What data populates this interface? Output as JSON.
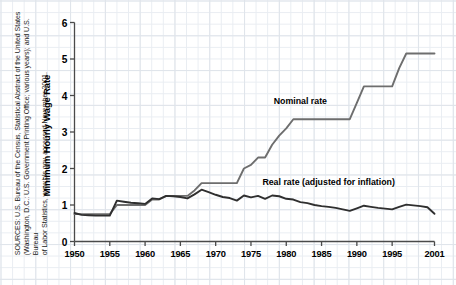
{
  "source_note": "SOURCES: U.S. Bureau of the Census, Statistical Abstract of the United States\n(Washington, D.C.: U.S. Government Printing Office; various years); and U.S. Bureau\nof Labor Statistics, www.bls.gov, accessed November 2001.",
  "colors": {
    "nominal": "#6e6e6e",
    "real": "#2f2f2f",
    "axis": "#4a4a4a",
    "grid_minor": "#e9edf2",
    "grid_major": "#dfe4ea",
    "text": "#000000"
  },
  "labels": {
    "nominal": "Nominal rate",
    "real": "Real rate (adjusted for inflation)"
  },
  "chart_data": {
    "type": "line",
    "title": "",
    "xlabel": "",
    "ylabel": "Minimum Hourly Wage Rate",
    "xlim": [
      1950,
      2001
    ],
    "ylim": [
      0,
      6
    ],
    "yticks": [
      0,
      1,
      2,
      3,
      4,
      5,
      6
    ],
    "ytick_labels": [
      "0",
      "1",
      "2",
      "3",
      "4",
      "5",
      "6"
    ],
    "xticks": [
      1950,
      1955,
      1960,
      1965,
      1970,
      1975,
      1980,
      1985,
      1990,
      1995,
      2001
    ],
    "xtick_labels": [
      "1950",
      "1955",
      "1960",
      "1965",
      "1970",
      "1975",
      "1980",
      "1985",
      "1990",
      "1995",
      "2001"
    ],
    "grid": true,
    "legend": "inline-annotations",
    "x": [
      1950,
      1951,
      1952,
      1953,
      1954,
      1955,
      1956,
      1957,
      1958,
      1959,
      1960,
      1961,
      1962,
      1963,
      1964,
      1965,
      1966,
      1967,
      1968,
      1969,
      1970,
      1971,
      1972,
      1973,
      1974,
      1975,
      1976,
      1977,
      1978,
      1979,
      1980,
      1981,
      1982,
      1983,
      1984,
      1985,
      1986,
      1987,
      1988,
      1989,
      1990,
      1991,
      1992,
      1993,
      1994,
      1995,
      1996,
      1997,
      1998,
      1999,
      2000,
      2001
    ],
    "series": [
      {
        "name": "Nominal rate",
        "color": "#6e6e6e",
        "values": [
          0.75,
          0.75,
          0.75,
          0.75,
          0.75,
          0.75,
          1.0,
          1.0,
          1.0,
          1.0,
          1.0,
          1.15,
          1.15,
          1.25,
          1.25,
          1.25,
          1.25,
          1.4,
          1.6,
          1.6,
          1.6,
          1.6,
          1.6,
          1.6,
          2.0,
          2.1,
          2.3,
          2.3,
          2.65,
          2.9,
          3.1,
          3.35,
          3.35,
          3.35,
          3.35,
          3.35,
          3.35,
          3.35,
          3.35,
          3.35,
          3.8,
          4.25,
          4.25,
          4.25,
          4.25,
          4.25,
          4.75,
          5.15,
          5.15,
          5.15,
          5.15,
          5.15
        ],
        "annotation": {
          "text": "Nominal rate",
          "x": 1982,
          "y": 3.85
        }
      },
      {
        "name": "Real rate (adjusted for inflation)",
        "color": "#2f2f2f",
        "values": [
          0.78,
          0.73,
          0.72,
          0.71,
          0.71,
          0.71,
          1.12,
          1.09,
          1.06,
          1.05,
          1.03,
          1.18,
          1.16,
          1.25,
          1.24,
          1.22,
          1.18,
          1.29,
          1.42,
          1.35,
          1.28,
          1.22,
          1.19,
          1.12,
          1.26,
          1.21,
          1.25,
          1.17,
          1.26,
          1.24,
          1.17,
          1.15,
          1.08,
          1.05,
          1.0,
          0.97,
          0.95,
          0.92,
          0.88,
          0.84,
          0.91,
          0.98,
          0.95,
          0.92,
          0.9,
          0.88,
          0.95,
          1.01,
          0.99,
          0.97,
          0.94,
          0.76
        ],
        "annotation": {
          "text": "Real rate (adjusted for inflation)",
          "x": 1986,
          "y": 1.62
        }
      }
    ]
  }
}
